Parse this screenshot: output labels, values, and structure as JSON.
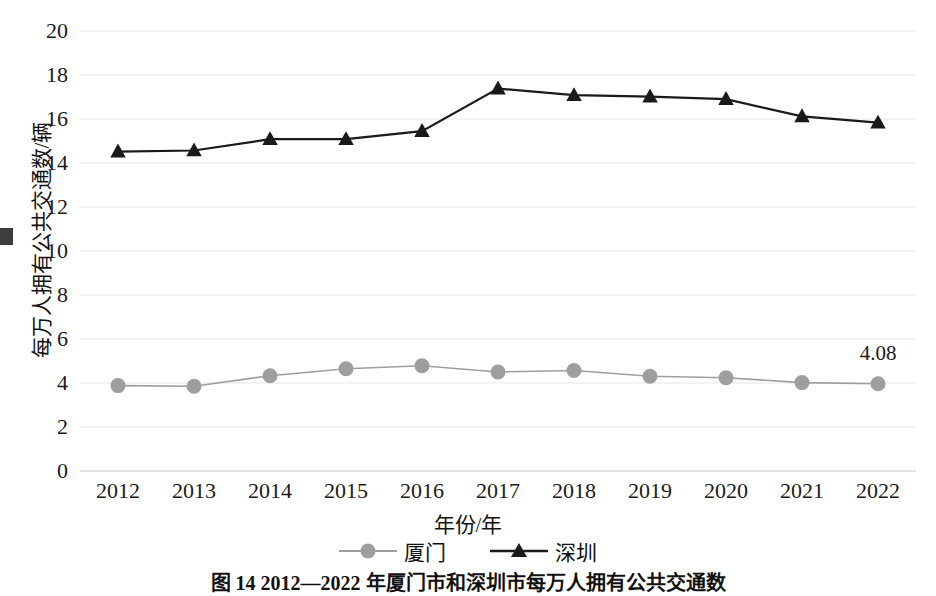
{
  "chart_data": {
    "type": "line",
    "title": "图 14  2012—2022 年厦门市和深圳市每万人拥有公共交通数",
    "xlabel": "年份/年",
    "ylabel": "每万人拥有公共交通数/辆",
    "categories": [
      "2012",
      "2013",
      "2014",
      "2015",
      "2016",
      "2017",
      "2018",
      "2019",
      "2020",
      "2021",
      "2022"
    ],
    "ylim": [
      0,
      20
    ],
    "ytick_step": 2,
    "yticks": [
      "20",
      "18",
      "16",
      "14",
      "12",
      "10",
      "8",
      "6",
      "4",
      "2",
      "0"
    ],
    "grid": true,
    "legend_position": "bottom",
    "series": [
      {
        "name": "厦门",
        "marker": "circle",
        "color": "#9e9e9e",
        "values": [
          3.88,
          3.85,
          4.33,
          4.65,
          4.78,
          4.5,
          4.57,
          4.31,
          4.24,
          4.02,
          3.97
        ]
      },
      {
        "name": "深圳",
        "marker": "triangle",
        "color": "#1a1a1a",
        "values": [
          14.52,
          14.57,
          15.08,
          15.08,
          15.45,
          17.38,
          17.08,
          17.02,
          16.9,
          16.12,
          15.83
        ]
      }
    ],
    "annotations": [
      {
        "text": "4.08",
        "series": "厦门",
        "category": "2022"
      }
    ]
  },
  "legend": {
    "items": [
      {
        "label": "厦门",
        "marker": "circle-marker",
        "color": "#9e9e9e"
      },
      {
        "label": "深圳",
        "marker": "triangle-marker",
        "color": "#1a1a1a"
      }
    ]
  },
  "axes": {
    "x_title": "年份/年",
    "y_title": "每万人拥有公共交通数/辆"
  },
  "caption": {
    "text": "图 14  2012—2022 年厦门市和深圳市每万人拥有公共交通数"
  },
  "colors": {
    "xiamen": "#9e9e9e",
    "shenzhen": "#1a1a1a",
    "grid": "#e8e8e8",
    "axis": "#d9d9d9",
    "text": "#1a1a1a"
  }
}
